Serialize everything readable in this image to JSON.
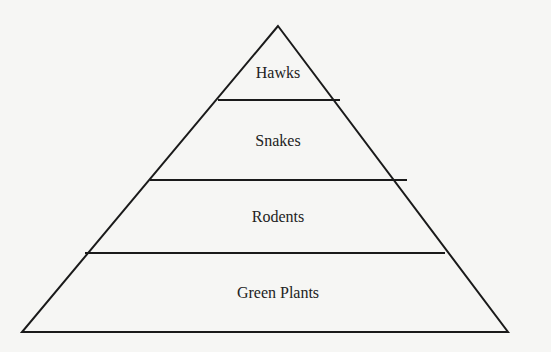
{
  "diagram": {
    "type": "food-pyramid",
    "levels": [
      {
        "label": "Hawks",
        "role": "top"
      },
      {
        "label": "Snakes",
        "role": "upper-middle"
      },
      {
        "label": "Rodents",
        "role": "lower-middle"
      },
      {
        "label": "Green Plants",
        "role": "base"
      }
    ],
    "line_color": "#1a1a1a",
    "background": "#f6f6f4"
  }
}
